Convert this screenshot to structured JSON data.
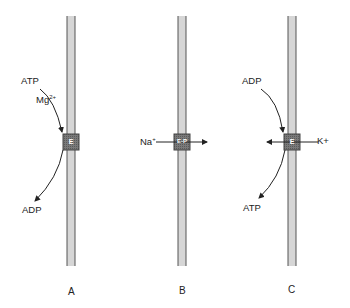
{
  "diagram": {
    "panels": [
      {
        "id": "A",
        "label": "A",
        "enzyme_label": "E",
        "inputs": [
          {
            "text": "ATP"
          },
          {
            "text": "Mg",
            "sup": "2+"
          }
        ],
        "outputs": [
          {
            "text": "ADP"
          }
        ]
      },
      {
        "id": "B",
        "label": "B",
        "enzyme_label": "E-P",
        "ion": {
          "text": "Na",
          "sup": "+",
          "direction": "left-to-right"
        }
      },
      {
        "id": "C",
        "label": "C",
        "enzyme_label": "E",
        "inputs": [
          {
            "text": "ADP"
          }
        ],
        "outputs": [
          {
            "text": "ATP"
          }
        ],
        "ion": {
          "text": "K+",
          "direction": "right-to-left"
        }
      }
    ],
    "colors": {
      "membrane_fill": "#d4d4d4",
      "membrane_edge": "#555555",
      "enzyme_fill": "#6e6e6e",
      "arrow": "#222222"
    }
  }
}
